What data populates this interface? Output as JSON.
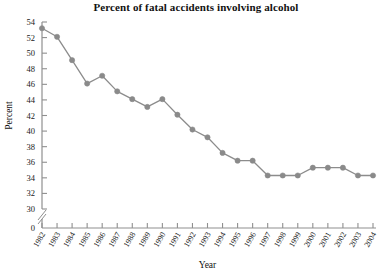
{
  "chart_data": {
    "type": "line",
    "title": "Percent of fatal accidents involving alcohol",
    "xlabel": "Year",
    "ylabel": "Percent",
    "grid": false,
    "legend": "none",
    "ylim": [
      30,
      54
    ],
    "ytick_step": 2,
    "y_axis_break": true,
    "y_break_label": "0",
    "yticks": [
      "54",
      "52",
      "50",
      "48",
      "46",
      "44",
      "42",
      "40",
      "38",
      "36",
      "34",
      "32",
      "30",
      "0"
    ],
    "categories": [
      "1982",
      "1983",
      "1984",
      "1985",
      "1986",
      "1987",
      "1988",
      "1989",
      "1990",
      "1991",
      "1992",
      "1993",
      "1994",
      "1995",
      "1996",
      "1997",
      "1998",
      "1999",
      "2000",
      "2001",
      "2002",
      "2003",
      "2004"
    ],
    "values": [
      53.2,
      52.1,
      49.1,
      46.1,
      47.1,
      45.1,
      44.1,
      43.1,
      44.1,
      42.1,
      40.2,
      39.2,
      37.2,
      36.2,
      36.2,
      34.3,
      34.3,
      34.3,
      35.3,
      35.3,
      35.3,
      34.3,
      34.3
    ],
    "series_color": "#8c8c8c",
    "marker_color": "#8a8a8a",
    "axis_color": "#8f8f8f",
    "text_color": "#111111"
  }
}
